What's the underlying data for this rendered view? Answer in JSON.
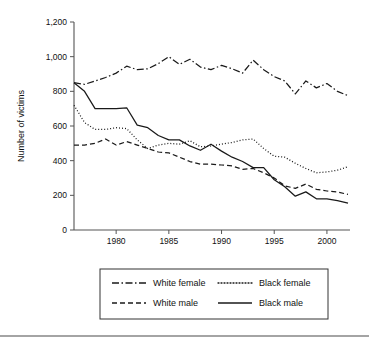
{
  "chart_data": {
    "type": "line",
    "title": "",
    "xlabel": "",
    "ylabel": "Number of victims",
    "xlim": [
      1976,
      2002
    ],
    "ylim": [
      0,
      1200
    ],
    "grid": false,
    "legend_position": "bottom",
    "x": [
      1976,
      1977,
      1978,
      1979,
      1980,
      1981,
      1982,
      1983,
      1984,
      1985,
      1986,
      1987,
      1988,
      1989,
      1990,
      1991,
      1992,
      1993,
      1994,
      1995,
      1996,
      1997,
      1998,
      1999,
      2000,
      2001,
      2002
    ],
    "xticks": [
      1980,
      1985,
      1990,
      1995,
      2000
    ],
    "xtick_labels": [
      "1980",
      "1985",
      "1990",
      "1995",
      "2000"
    ],
    "yticks": [
      0,
      200,
      400,
      600,
      800,
      1000,
      1200
    ],
    "ytick_labels": [
      "0",
      "200",
      "400",
      "600",
      "800",
      "1,000",
      "1,200"
    ],
    "series": [
      {
        "name": "White female",
        "style": "dash-dot",
        "values": [
          850,
          840,
          860,
          880,
          905,
          945,
          925,
          930,
          960,
          1000,
          955,
          985,
          940,
          925,
          950,
          930,
          905,
          980,
          925,
          885,
          860,
          785,
          860,
          820,
          845,
          800,
          775
        ]
      },
      {
        "name": "Black female",
        "style": "dotted",
        "values": [
          720,
          620,
          580,
          580,
          590,
          585,
          520,
          470,
          490,
          500,
          495,
          515,
          480,
          485,
          495,
          505,
          520,
          525,
          470,
          425,
          420,
          385,
          355,
          330,
          335,
          345,
          365
        ]
      },
      {
        "name": "White male",
        "style": "dashed",
        "values": [
          490,
          490,
          500,
          525,
          490,
          510,
          490,
          470,
          450,
          445,
          420,
          395,
          380,
          380,
          375,
          370,
          350,
          355,
          330,
          300,
          255,
          240,
          265,
          235,
          225,
          220,
          205
        ]
      },
      {
        "name": "Black male",
        "style": "solid",
        "values": [
          850,
          800,
          700,
          700,
          700,
          705,
          605,
          590,
          545,
          520,
          520,
          485,
          460,
          495,
          455,
          420,
          395,
          360,
          360,
          290,
          250,
          195,
          220,
          180,
          180,
          170,
          155
        ]
      }
    ]
  },
  "legend": {
    "entries": [
      {
        "label": "White female",
        "style": "dash-dot"
      },
      {
        "label": "Black female",
        "style": "dotted"
      },
      {
        "label": "White male",
        "style": "dashed"
      },
      {
        "label": "Black male",
        "style": "solid"
      }
    ]
  },
  "colors": {
    "ink": "#1a1a1a",
    "axis": "#555555",
    "background": "#ffffff"
  }
}
